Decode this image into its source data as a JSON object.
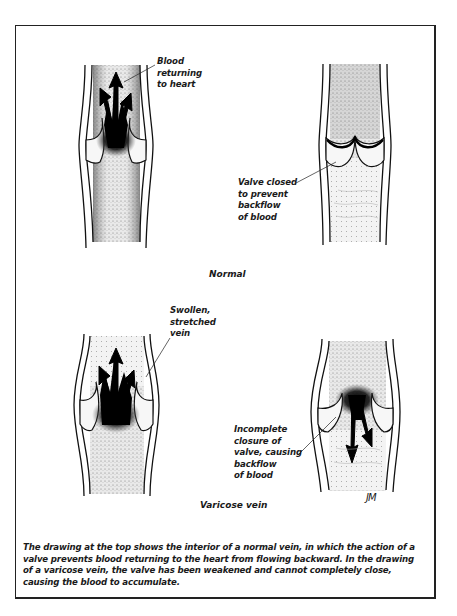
{
  "figure": {
    "sections": [
      {
        "title": "Normal",
        "drawings": [
          {
            "name": "normal-vein-open-valve",
            "label": "Blood\nreturning\nto heart"
          },
          {
            "name": "normal-vein-closed-valve",
            "label": "Valve closed\nto prevent\nbackflow\nof blood"
          }
        ]
      },
      {
        "title": "Varicose vein",
        "drawings": [
          {
            "name": "varicose-vein-upflow",
            "label": "Swollen,\nstretched\nvein"
          },
          {
            "name": "varicose-vein-backflow",
            "label": "Incomplete\nclosure of\nvalve, causing\nbackflow\nof blood"
          }
        ]
      }
    ],
    "signature": "JM",
    "caption": "The drawing at the top shows the interior of a normal vein, in which the action of a valve prevents blood returning to the heart from flowing backward. In the drawing of a varicose vein, the valve has been weakened and cannot completely close, causing the blood to accumulate."
  }
}
